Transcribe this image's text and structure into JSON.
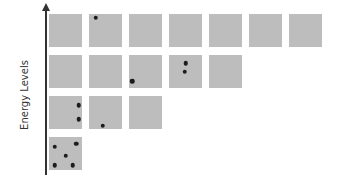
{
  "diagram": {
    "axis_label": "Energy Levels",
    "colors": {
      "square": "#bdbdbd",
      "dot": "#1c1c1c",
      "axis": "#333333"
    },
    "rows": [
      {
        "level": 4,
        "squares": [
          {
            "dots": []
          },
          {
            "dots": [
              [
                0.2,
                0.12
              ]
            ]
          },
          {
            "dots": []
          },
          {
            "dots": []
          },
          {
            "dots": []
          },
          {
            "dots": []
          },
          {
            "dots": []
          }
        ]
      },
      {
        "level": 3,
        "squares": [
          {
            "dots": []
          },
          {
            "dots": []
          },
          {
            "dots": [
              [
                0.1,
                0.8
              ]
            ]
          },
          {
            "dots": [
              [
                0.5,
                0.25
              ],
              [
                0.48,
                0.5
              ]
            ]
          },
          {
            "dots": []
          }
        ]
      },
      {
        "level": 2,
        "squares": [
          {
            "dots": [
              [
                0.9,
                0.28
              ],
              [
                0.9,
                0.7
              ]
            ]
          },
          {
            "dots": [
              [
                0.42,
                0.9
              ]
            ]
          },
          {
            "dots": []
          }
        ]
      },
      {
        "level": 1,
        "squares": [
          {
            "dots": [
              [
                0.17,
                0.3
              ],
              [
                0.82,
                0.2
              ],
              [
                0.5,
                0.57
              ],
              [
                0.17,
                0.85
              ],
              [
                0.72,
                0.85
              ]
            ]
          }
        ]
      }
    ]
  }
}
